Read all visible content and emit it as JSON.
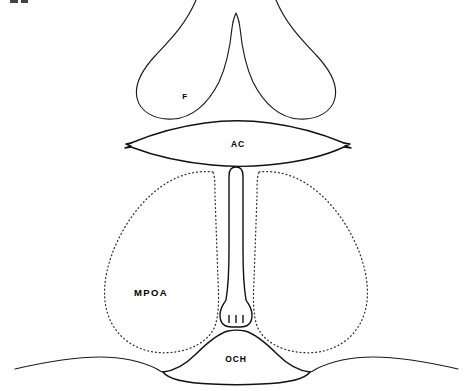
{
  "figure": {
    "background_color": "#ffffff",
    "line_color": "#111111",
    "dotted_outline_color": "#2b2b2b",
    "width": 464,
    "height": 391
  },
  "labels": {
    "fornix": "F",
    "anterior_commissure": "AC",
    "medial_preoptic_area": "MPOA",
    "third_ventricle": "III",
    "optic_chiasm": "OCH"
  },
  "structures": [
    {
      "id": "fornix",
      "abbrev": "F",
      "outline": "solid",
      "label_x": 185,
      "label_y": 97
    },
    {
      "id": "anterior-commissure",
      "abbrev": "AC",
      "outline": "solid",
      "label_x": 238,
      "label_y": 145
    },
    {
      "id": "medial-preoptic-area",
      "abbrev": "MPOA",
      "outline": "dotted",
      "label_x": 151,
      "label_y": 293
    },
    {
      "id": "third-ventricle",
      "abbrev": "III",
      "outline": "solid",
      "label_x": 234,
      "label_y": 319
    },
    {
      "id": "optic-chiasm",
      "abbrev": "OCH",
      "outline": "solid",
      "label_x": 236,
      "label_y": 360
    }
  ]
}
